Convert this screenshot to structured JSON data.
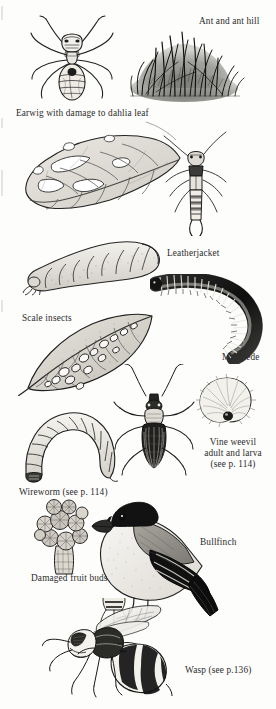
{
  "page": {
    "kind": "illustrated-plate",
    "background_color": "#fdfdfc",
    "ink_color": "#2b2b2b",
    "width": 276,
    "height": 709
  },
  "captions": [
    {
      "id": "ant-and-ant-hill",
      "text": "Ant and ant hill",
      "x": 199,
      "y": 16,
      "align": "left"
    },
    {
      "id": "earwig-dahlia",
      "text": "Earwig with damage to dahlia leaf",
      "x": 16,
      "y": 108,
      "align": "left"
    },
    {
      "id": "leatherjacket",
      "text": "Leatherjacket",
      "x": 167,
      "y": 248,
      "align": "left"
    },
    {
      "id": "scale-insects",
      "text": "Scale insects",
      "x": 22,
      "y": 313,
      "align": "left"
    },
    {
      "id": "millipede",
      "text": "Millipede",
      "x": 222,
      "y": 352,
      "align": "left"
    },
    {
      "id": "vine-weevil",
      "text": "Vine weevil\nadult and larva\n(see p. 114)",
      "x": 199,
      "y": 437,
      "align": "center"
    },
    {
      "id": "wireworm",
      "text": "Wireworm (see p. 114)",
      "x": 19,
      "y": 487,
      "align": "left"
    },
    {
      "id": "bullfinch",
      "text": "Bullfinch",
      "x": 200,
      "y": 537,
      "align": "left"
    },
    {
      "id": "damaged-fruit-buds",
      "text": "Damaged fruit buds",
      "x": 31,
      "y": 573,
      "align": "left"
    },
    {
      "id": "wasp",
      "text": "Wasp (see p.136)",
      "x": 185,
      "y": 665,
      "align": "left"
    }
  ],
  "illustrations": [
    {
      "id": "ant",
      "label": "Ant",
      "x": 22,
      "y": 14,
      "w": 100,
      "h": 96
    },
    {
      "id": "ant-hill",
      "label": "Ant hill with grass",
      "x": 122,
      "y": 18,
      "w": 126,
      "h": 84
    },
    {
      "id": "earwig-leaf",
      "label": "Earwig with damaged dahlia leaf",
      "x": 20,
      "y": 122,
      "w": 236,
      "h": 112
    },
    {
      "id": "leatherjacket",
      "label": "Leatherjacket larva",
      "x": 24,
      "y": 234,
      "w": 140,
      "h": 60
    },
    {
      "id": "millipede",
      "label": "Coiled millipede",
      "x": 152,
      "y": 276,
      "w": 110,
      "h": 86
    },
    {
      "id": "scale-leaf",
      "label": "Leaf with scale insects",
      "x": 20,
      "y": 312,
      "w": 150,
      "h": 82
    },
    {
      "id": "vine-weevil-larva",
      "label": "Vine weevil larva (curled grub)",
      "x": 196,
      "y": 372,
      "w": 62,
      "h": 56
    },
    {
      "id": "vine-weevil-adult",
      "label": "Vine weevil adult beetle",
      "x": 112,
      "y": 366,
      "w": 84,
      "h": 110
    },
    {
      "id": "wireworm",
      "label": "Wireworm larva",
      "x": 18,
      "y": 400,
      "w": 106,
      "h": 82
    },
    {
      "id": "fruit-buds",
      "label": "Damaged fruit buds on a spur",
      "x": 32,
      "y": 498,
      "w": 68,
      "h": 76
    },
    {
      "id": "bullfinch",
      "label": "Bullfinch bird",
      "x": 92,
      "y": 490,
      "w": 128,
      "h": 128
    },
    {
      "id": "wasp",
      "label": "Wasp",
      "x": 44,
      "y": 600,
      "w": 140,
      "h": 100
    }
  ]
}
